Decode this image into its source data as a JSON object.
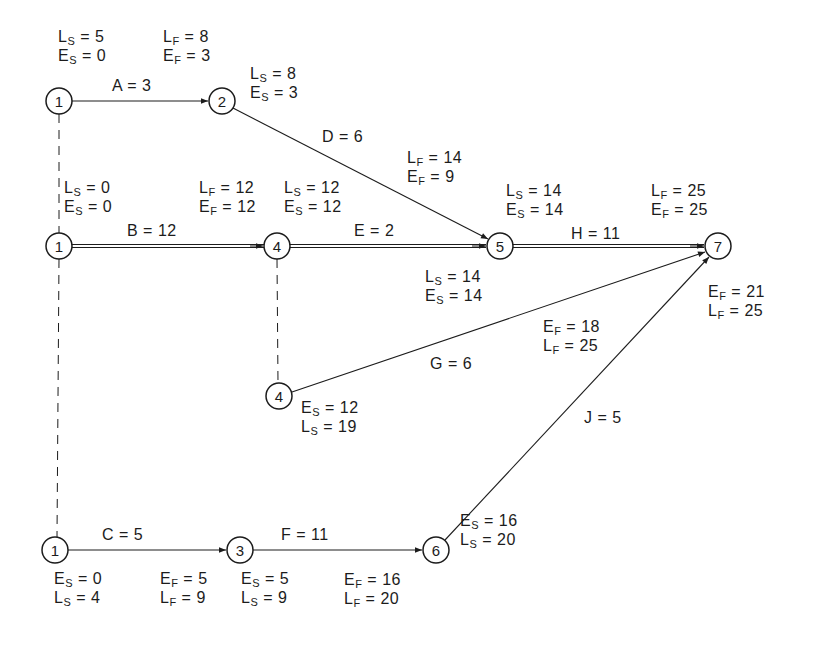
{
  "nodes": [
    {
      "id": "n1a",
      "label": "1",
      "x": 59,
      "y": 101
    },
    {
      "id": "n2",
      "label": "2",
      "x": 222,
      "y": 101
    },
    {
      "id": "n1b",
      "label": "1",
      "x": 59,
      "y": 246
    },
    {
      "id": "n4a",
      "label": "4",
      "x": 277,
      "y": 246
    },
    {
      "id": "n5",
      "label": "5",
      "x": 500,
      "y": 246
    },
    {
      "id": "n7",
      "label": "7",
      "x": 718,
      "y": 246
    },
    {
      "id": "n4b",
      "label": "4",
      "x": 279,
      "y": 396
    },
    {
      "id": "n1c",
      "label": "1",
      "x": 55,
      "y": 550
    },
    {
      "id": "n3",
      "label": "3",
      "x": 240,
      "y": 550
    },
    {
      "id": "n6",
      "label": "6",
      "x": 436,
      "y": 550
    }
  ],
  "activities": [
    {
      "id": "A",
      "label": "A = 3",
      "from": "n1a",
      "to": "n2",
      "critical": false
    },
    {
      "id": "B",
      "label": "B = 12",
      "from": "n1b",
      "to": "n4a",
      "critical": true
    },
    {
      "id": "C",
      "label": "C = 5",
      "from": "n1c",
      "to": "n3",
      "critical": false
    },
    {
      "id": "D",
      "label": "D = 6",
      "from": "n2",
      "to": "n5",
      "critical": false
    },
    {
      "id": "E",
      "label": "E = 2",
      "from": "n4a",
      "to": "n5",
      "critical": true
    },
    {
      "id": "F",
      "label": "F = 11",
      "from": "n3",
      "to": "n6",
      "critical": false
    },
    {
      "id": "G",
      "label": "G = 6",
      "from": "n4b",
      "to": "n7",
      "critical": false
    },
    {
      "id": "H",
      "label": "H = 11",
      "from": "n5",
      "to": "n7",
      "critical": true
    },
    {
      "id": "J",
      "label": "J = 5",
      "from": "n6",
      "to": "n7",
      "critical": false
    }
  ],
  "dummies": [
    {
      "from": "n1a",
      "to": "n1c"
    },
    {
      "from": "n4a",
      "to": "n4b"
    }
  ],
  "annotations": {
    "A_start": {
      "l1": {
        "k": "L",
        "s": "S",
        "v": "5"
      },
      "l2": {
        "k": "E",
        "s": "S",
        "v": "0"
      }
    },
    "A_finish": {
      "l1": {
        "k": "L",
        "s": "F",
        "v": "8"
      },
      "l2": {
        "k": "E",
        "s": "F",
        "v": "3"
      }
    },
    "D_start": {
      "l1": {
        "k": "L",
        "s": "S",
        "v": "8"
      },
      "l2": {
        "k": "E",
        "s": "S",
        "v": "3"
      }
    },
    "D_finish": {
      "l1": {
        "k": "L",
        "s": "F",
        "v": "14"
      },
      "l2": {
        "k": "E",
        "s": "F",
        "v": "9"
      }
    },
    "B_start": {
      "l1": {
        "k": "L",
        "s": "S",
        "v": "0"
      },
      "l2": {
        "k": "E",
        "s": "S",
        "v": "0"
      }
    },
    "B_finish": {
      "l1": {
        "k": "L",
        "s": "F",
        "v": "12"
      },
      "l2": {
        "k": "E",
        "s": "F",
        "v": "12"
      }
    },
    "E_start": {
      "l1": {
        "k": "L",
        "s": "S",
        "v": "12"
      },
      "l2": {
        "k": "E",
        "s": "S",
        "v": "12"
      }
    },
    "H_start": {
      "l1": {
        "k": "L",
        "s": "S",
        "v": "14"
      },
      "l2": {
        "k": "E",
        "s": "S",
        "v": "14"
      }
    },
    "H_finish": {
      "l1": {
        "k": "L",
        "s": "F",
        "v": "25"
      },
      "l2": {
        "k": "E",
        "s": "F",
        "v": "25"
      }
    },
    "E_finish": {
      "l1": {
        "k": "L",
        "s": "S",
        "v": "14"
      },
      "l2": {
        "k": "E",
        "s": "S",
        "v": "14"
      }
    },
    "J_finish": {
      "l1": {
        "k": "E",
        "s": "F",
        "v": "21"
      },
      "l2": {
        "k": "L",
        "s": "F",
        "v": "25"
      }
    },
    "G_finish": {
      "l1": {
        "k": "E",
        "s": "F",
        "v": "18"
      },
      "l2": {
        "k": "L",
        "s": "F",
        "v": "25"
      }
    },
    "G_start": {
      "l1": {
        "k": "E",
        "s": "S",
        "v": "12"
      },
      "l2": {
        "k": "L",
        "s": "S",
        "v": "19"
      }
    },
    "J_start": {
      "l1": {
        "k": "E",
        "s": "S",
        "v": "16"
      },
      "l2": {
        "k": "L",
        "s": "S",
        "v": "20"
      }
    },
    "C_start": {
      "l1": {
        "k": "E",
        "s": "S",
        "v": "0"
      },
      "l2": {
        "k": "L",
        "s": "S",
        "v": "4"
      }
    },
    "C_finish": {
      "l1": {
        "k": "E",
        "s": "F",
        "v": "5"
      },
      "l2": {
        "k": "L",
        "s": "F",
        "v": "9"
      }
    },
    "F_start": {
      "l1": {
        "k": "E",
        "s": "S",
        "v": "5"
      },
      "l2": {
        "k": "L",
        "s": "S",
        "v": "9"
      }
    },
    "F_finish": {
      "l1": {
        "k": "E",
        "s": "F",
        "v": "16"
      },
      "l2": {
        "k": "L",
        "s": "F",
        "v": "20"
      }
    }
  },
  "colors": {
    "ink": "#1c1c1c",
    "background": "#ffffff"
  }
}
